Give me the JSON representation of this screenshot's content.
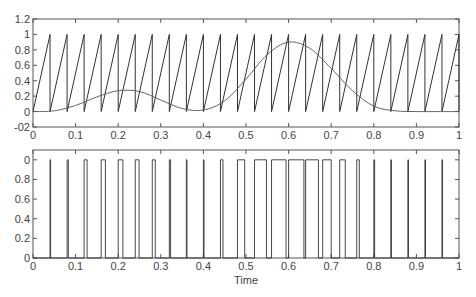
{
  "chart_data": [
    {
      "type": "line",
      "title": "",
      "xlabel": "",
      "ylabel": "",
      "xlim": [
        0,
        1
      ],
      "ylim": [
        -0.2,
        1.2
      ],
      "grid": false,
      "legend": null,
      "xticks": [
        "0",
        "0.1",
        "0.2",
        "0.3",
        "0.4",
        "0.5",
        "0.6",
        "0.7",
        "0.8",
        "0.9",
        "1"
      ],
      "yticks": [
        "-02",
        "0",
        "0.2",
        "0.4",
        "0.6",
        "0.8",
        "1",
        "1.2"
      ],
      "series": [
        {
          "name": "sawtooth carrier",
          "description": "Sawtooth ramp 0 to 1 with period 0.04 (25 cycles over 0-1 s)",
          "period": 0.04,
          "min": 0,
          "max": 1
        },
        {
          "name": "modulating signal",
          "description": "Smooth signal: near 0 at t=0, local peak ~0.28 at t≈0.21, trough ~0.0 at t≈0.38, peak ~0.9 at t≈0.6, returns to ~0 at t≈0.85 and stays flat",
          "x": [
            0,
            0.05,
            0.1,
            0.15,
            0.2,
            0.25,
            0.3,
            0.35,
            0.4,
            0.45,
            0.5,
            0.55,
            0.6,
            0.65,
            0.7,
            0.75,
            0.8,
            0.85,
            0.9,
            0.95,
            1.0
          ],
          "values": [
            0.0,
            0.01,
            0.08,
            0.19,
            0.27,
            0.26,
            0.15,
            0.04,
            0.02,
            0.14,
            0.42,
            0.74,
            0.9,
            0.82,
            0.56,
            0.27,
            0.07,
            0.01,
            0.0,
            0.0,
            0.0
          ]
        }
      ]
    },
    {
      "type": "line",
      "title": "",
      "xlabel": "Time",
      "ylabel": "",
      "xlim": [
        0,
        1
      ],
      "ylim": [
        0,
        1.1
      ],
      "grid": false,
      "legend": null,
      "xticks": [
        "0",
        "0.1",
        "0.2",
        "0.3",
        "0.4",
        "0.5",
        "0.6",
        "0.7",
        "0.8",
        "0.9",
        "1"
      ],
      "yticks": [
        "0",
        "0.2",
        "0.4",
        "0.6",
        "0.8",
        "0"
      ],
      "series": [
        {
          "name": "PWM output",
          "description": "Pulse train (0/1) where pulse is high while modulating signal exceeds sawtooth; pulse widths track modulating signal",
          "pulses": [
            {
              "start": 0.04,
              "width": 0.001
            },
            {
              "start": 0.08,
              "width": 0.003
            },
            {
              "start": 0.12,
              "width": 0.007
            },
            {
              "start": 0.16,
              "width": 0.01
            },
            {
              "start": 0.2,
              "width": 0.011
            },
            {
              "start": 0.24,
              "width": 0.009
            },
            {
              "start": 0.28,
              "width": 0.007
            },
            {
              "start": 0.32,
              "width": 0.003
            },
            {
              "start": 0.36,
              "width": 0.001
            },
            {
              "start": 0.4,
              "width": 0.001
            },
            {
              "start": 0.44,
              "width": 0.006
            },
            {
              "start": 0.48,
              "width": 0.017
            },
            {
              "start": 0.52,
              "width": 0.028
            },
            {
              "start": 0.56,
              "width": 0.034
            },
            {
              "start": 0.6,
              "width": 0.036
            },
            {
              "start": 0.64,
              "width": 0.03
            },
            {
              "start": 0.68,
              "width": 0.02
            },
            {
              "start": 0.72,
              "width": 0.013
            },
            {
              "start": 0.76,
              "width": 0.006
            },
            {
              "start": 0.8,
              "width": 0.002
            },
            {
              "start": 0.84,
              "width": 0.001
            },
            {
              "start": 0.88,
              "width": 0.001
            },
            {
              "start": 0.92,
              "width": 0.001
            },
            {
              "start": 0.96,
              "width": 0.001
            }
          ]
        }
      ]
    }
  ],
  "layout": {
    "top": {
      "left": 33,
      "top": 19,
      "right": 459,
      "bottom": 127
    },
    "bottom": {
      "left": 33,
      "top": 150,
      "right": 459,
      "bottom": 258
    }
  },
  "colors": {
    "line": "#333333",
    "axis": "#555555",
    "signal": "#555555"
  }
}
